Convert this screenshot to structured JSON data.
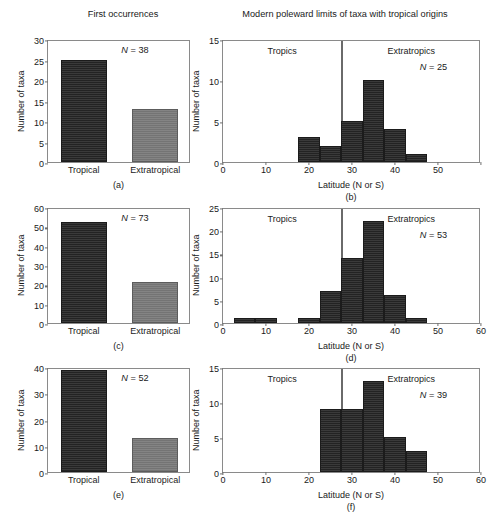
{
  "figure": {
    "left_column_title": "First occurrences",
    "right_column_title": "Modern poleward limits of taxa with tropical origins",
    "axis_label_y": "Number of taxa",
    "axis_label_x_right": "Latitude (N or S)",
    "region_label_tropics": "Tropics",
    "region_label_extratropics": "Extratropics",
    "category_tropical": "Tropical",
    "category_extratropical": "Extratropical",
    "colors": {
      "tropical_bar": "#2f2f2f",
      "extratropical_bar": "#7b7b7b",
      "axis": "#6f6f6f",
      "background": "#ffffff",
      "divider": "#6a6a6a"
    },
    "tropic_boundary_latitude": 27.5
  },
  "panels": {
    "a": {
      "letter": "(a)",
      "n_label": "N = 38",
      "n_value": 38,
      "ymax": 30,
      "yticks": [
        "0",
        "5",
        "10",
        "15",
        "20",
        "25",
        "30"
      ],
      "xticks": [
        "Tropical",
        "Extratropical"
      ],
      "values": [
        25,
        13
      ]
    },
    "b": {
      "letter": "(b)",
      "n_label": "N = 25",
      "n_value": 25,
      "ymax": 15,
      "yticks": [
        "0",
        "5",
        "10",
        "15"
      ],
      "xmax": 60,
      "xticks": [
        "0",
        "10",
        "20",
        "30",
        "40",
        "50"
      ],
      "xtick_values": [
        0,
        10,
        20,
        30,
        40,
        50
      ],
      "bin_starts": [
        17.5,
        22.5,
        27.5,
        32.5,
        37.5,
        42.5
      ],
      "bin_width": 5,
      "values": [
        3,
        2,
        5,
        10,
        4,
        1
      ]
    },
    "c": {
      "letter": "(c)",
      "n_label": "N = 73",
      "n_value": 73,
      "ymax": 60,
      "yticks": [
        "0",
        "10",
        "20",
        "30",
        "40",
        "50",
        "60"
      ],
      "xticks": [
        "Tropical",
        "Extratropical"
      ],
      "values": [
        52,
        21
      ]
    },
    "d": {
      "letter": "(d)",
      "n_label": "N = 53",
      "n_value": 53,
      "ymax": 25,
      "yticks": [
        "0",
        "5",
        "10",
        "15",
        "20",
        "25"
      ],
      "xmax": 60,
      "xticks": [
        "0",
        "10",
        "20",
        "30",
        "40",
        "50",
        "60"
      ],
      "xtick_values": [
        0,
        10,
        20,
        30,
        40,
        50,
        60
      ],
      "bin_starts": [
        2.5,
        7.5,
        17.5,
        22.5,
        27.5,
        32.5,
        37.5,
        42.5
      ],
      "bin_width": 5,
      "values": [
        1,
        1,
        1,
        7,
        14,
        22,
        6,
        1
      ]
    },
    "e": {
      "letter": "(e)",
      "n_label": "N = 52",
      "n_value": 52,
      "ymax": 40,
      "yticks": [
        "0",
        "10",
        "20",
        "30",
        "40"
      ],
      "xticks": [
        "Tropical",
        "Extratropical"
      ],
      "values": [
        39,
        13
      ]
    },
    "f": {
      "letter": "(f)",
      "n_label": "N = 39",
      "n_value": 39,
      "ymax": 15,
      "yticks": [
        "0",
        "5",
        "10",
        "15"
      ],
      "xmax": 60,
      "xticks": [
        "0",
        "10",
        "20",
        "30",
        "40",
        "50",
        "60"
      ],
      "xtick_values": [
        0,
        10,
        20,
        30,
        40,
        50,
        60
      ],
      "bin_starts": [
        22.5,
        27.5,
        32.5,
        37.5,
        42.5
      ],
      "bin_width": 5,
      "values": [
        9,
        9,
        13,
        5,
        3
      ]
    }
  },
  "chart_data": [
    {
      "type": "bar",
      "panel": "a",
      "title": "First occurrences",
      "categories": [
        "Tropical",
        "Extratropical"
      ],
      "values": [
        25,
        13
      ],
      "xlabel": "",
      "ylabel": "Number of taxa",
      "ylim": [
        0,
        30
      ],
      "annotations": [
        "N = 38"
      ],
      "grid": false,
      "legend": "none"
    },
    {
      "type": "bar",
      "panel": "b",
      "title": "Modern poleward limits of taxa with tropical origins",
      "x": [
        20,
        25,
        30,
        35,
        40,
        45
      ],
      "bin_edges": [
        17.5,
        22.5,
        27.5,
        32.5,
        37.5,
        42.5,
        47.5
      ],
      "values": [
        3,
        2,
        5,
        10,
        4,
        1
      ],
      "xlabel": "Latitude (N or S)",
      "ylabel": "Number of taxa",
      "xlim": [
        0,
        60
      ],
      "ylim": [
        0,
        15
      ],
      "annotations": [
        "N = 25",
        "Tropics",
        "Extratropics"
      ],
      "vline": 27.5,
      "grid": false,
      "legend": "none"
    },
    {
      "type": "bar",
      "panel": "c",
      "title": "First occurrences",
      "categories": [
        "Tropical",
        "Extratropical"
      ],
      "values": [
        52,
        21
      ],
      "xlabel": "",
      "ylabel": "Number of taxa",
      "ylim": [
        0,
        60
      ],
      "annotations": [
        "N = 73"
      ],
      "grid": false,
      "legend": "none"
    },
    {
      "type": "bar",
      "panel": "d",
      "title": "Modern poleward limits of taxa with tropical origins",
      "x": [
        5,
        10,
        20,
        25,
        30,
        35,
        40,
        45
      ],
      "bin_edges": [
        2.5,
        7.5,
        12.5,
        17.5,
        22.5,
        27.5,
        32.5,
        37.5,
        42.5,
        47.5
      ],
      "values": [
        1,
        1,
        1,
        7,
        14,
        22,
        6,
        1
      ],
      "xlabel": "Latitude (N or S)",
      "ylabel": "Number of taxa",
      "xlim": [
        0,
        60
      ],
      "ylim": [
        0,
        25
      ],
      "annotations": [
        "N = 53",
        "Tropics",
        "Extratropics"
      ],
      "vline": 27.5,
      "grid": false,
      "legend": "none"
    },
    {
      "type": "bar",
      "panel": "e",
      "title": "First occurrences",
      "categories": [
        "Tropical",
        "Extratropical"
      ],
      "values": [
        39,
        13
      ],
      "xlabel": "",
      "ylabel": "Number of taxa",
      "ylim": [
        0,
        40
      ],
      "annotations": [
        "N = 52"
      ],
      "grid": false,
      "legend": "none"
    },
    {
      "type": "bar",
      "panel": "f",
      "title": "Modern poleward limits of taxa with tropical origins",
      "x": [
        25,
        30,
        35,
        40,
        45
      ],
      "bin_edges": [
        22.5,
        27.5,
        32.5,
        37.5,
        42.5,
        47.5
      ],
      "values": [
        9,
        9,
        13,
        5,
        3
      ],
      "xlabel": "Latitude (N or S)",
      "ylabel": "Number of taxa",
      "xlim": [
        0,
        60
      ],
      "ylim": [
        0,
        15
      ],
      "annotations": [
        "N = 39",
        "Tropics",
        "Extratropics"
      ],
      "vline": 27.5,
      "grid": false,
      "legend": "none"
    }
  ]
}
